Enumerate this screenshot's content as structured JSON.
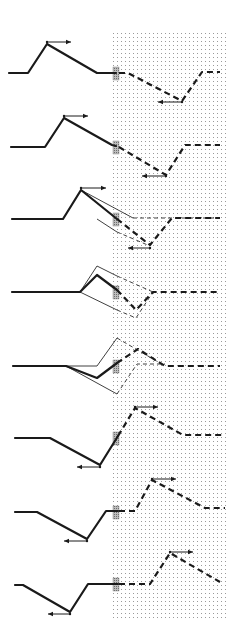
{
  "diagram": {
    "colors": {
      "background": "#ffffff",
      "ink": "#1a1a1a",
      "dot_grid": "#9a9a9a",
      "barrier": "#8c8c8c"
    },
    "medium_region": {
      "x": 113,
      "y": 33,
      "width": 113,
      "height": 587,
      "pattern": "dot-grid"
    },
    "barrier": {
      "x": 113,
      "width": 6
    },
    "panels": [
      {
        "id": 1,
        "baseline_y": 73,
        "solid": "M9,73 L28,73 L47,44 L97,73 L116,73",
        "dashed": "M119,73 L128,73 L182,101 L202,72 L220,72",
        "thin": [],
        "thin_dashed": [],
        "arrows": [
          {
            "from": [
              47,
              42
            ],
            "to": [
              71,
              42
            ],
            "direction": "right"
          },
          {
            "from": [
              182,
              102
            ],
            "to": [
              158,
              102
            ],
            "direction": "left"
          }
        ]
      },
      {
        "id": 2,
        "baseline_y": 147,
        "solid": "M11,147 L45,147 L64,118 L112,145 L116,146",
        "dashed": "M119,147 L166,175 L185,145 L220,145",
        "thin": [],
        "thin_dashed": [],
        "arrows": [
          {
            "from": [
              64,
              116
            ],
            "to": [
              88,
              116
            ],
            "direction": "right"
          },
          {
            "from": [
              166,
              176
            ],
            "to": [
              142,
              176
            ],
            "direction": "left"
          }
        ]
      },
      {
        "id": 3,
        "baseline_y": 219,
        "solid": "M12,219 L63,219 L81,190 L117,219",
        "dashed": "M117,219 L150,245 L172,218 L220,218",
        "thin": [
          "M81,190 L133,218",
          "M97,219 L117,232"
        ],
        "thin_dashed": [
          "M133,218 L220,218",
          "M117,232 L150,246"
        ],
        "arrows": [
          {
            "from": [
              81,
              188
            ],
            "to": [
              106,
              188
            ],
            "direction": "right"
          },
          {
            "from": [
              150,
              248
            ],
            "to": [
              128,
              248
            ],
            "direction": "left"
          }
        ]
      },
      {
        "id": 4,
        "baseline_y": 292,
        "solid": "M12,292 L80,292 L97,275 L117,290",
        "dashed": "M117,290 L136,310 L153,292 L220,292",
        "thin": [
          "M80,292 L97,266 L117,276",
          "M80,292 L117,310"
        ],
        "thin_dashed": [
          "M117,276 L153,292",
          "M117,310 L136,318 L153,292"
        ],
        "arrows": []
      },
      {
        "id": 5,
        "baseline_y": 366,
        "solid": "M13,366 L66,366 L97,378 L117,363",
        "dashed": "M117,363 L138,349 L165,366 L220,366",
        "thin": [
          "M66,366 L97,366 L117,338",
          "M66,366 L117,394"
        ],
        "thin_dashed": [
          "M117,338 L165,366",
          "M117,394 L137,364 L165,364"
        ],
        "arrows": []
      },
      {
        "id": 6,
        "baseline_y": 438,
        "solid": "M15,438 L50,438 L100,465 L118,436",
        "dashed": "M118,436 L135,408 L183,435 L223,435",
        "thin": [],
        "thin_dashed": [],
        "arrows": [
          {
            "from": [
              135,
              407
            ],
            "to": [
              158,
              407
            ],
            "direction": "right"
          },
          {
            "from": [
              100,
              467
            ],
            "to": [
              77,
              467
            ],
            "direction": "left"
          }
        ]
      },
      {
        "id": 7,
        "baseline_y": 512,
        "solid": "M15,512 L37,512 L87,539 L106,511 L118,511",
        "dashed": "M119,511 L135,511 L152,480 L205,508 L225,508",
        "thin": [],
        "thin_dashed": [],
        "arrows": [
          {
            "from": [
              152,
              479
            ],
            "to": [
              176,
              479
            ],
            "direction": "right"
          },
          {
            "from": [
              87,
              541
            ],
            "to": [
              64,
              541
            ],
            "direction": "left"
          }
        ]
      },
      {
        "id": 8,
        "baseline_y": 584,
        "solid": "M15,585 L23,585 L70,612 L88,584 L118,584",
        "dashed": "M119,584 L150,584 L170,553 L220,582",
        "thin": [],
        "thin_dashed": [],
        "arrows": [
          {
            "from": [
              170,
              552
            ],
            "to": [
              193,
              552
            ],
            "direction": "right"
          },
          {
            "from": [
              70,
              614
            ],
            "to": [
              48,
              614
            ],
            "direction": "left"
          }
        ]
      }
    ]
  }
}
